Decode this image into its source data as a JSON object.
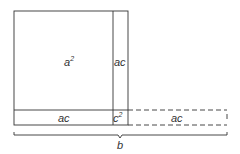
{
  "diagram": {
    "labels": {
      "a_squared": {
        "base": "a",
        "exp": "2"
      },
      "ac_right": "ac",
      "ac_bottom": "ac",
      "c_squared": {
        "base": "c",
        "exp": "2"
      },
      "ac_dashed": "ac",
      "brace_label": "b"
    },
    "colors": {
      "stroke": "#333333",
      "background": "#ffffff"
    }
  }
}
